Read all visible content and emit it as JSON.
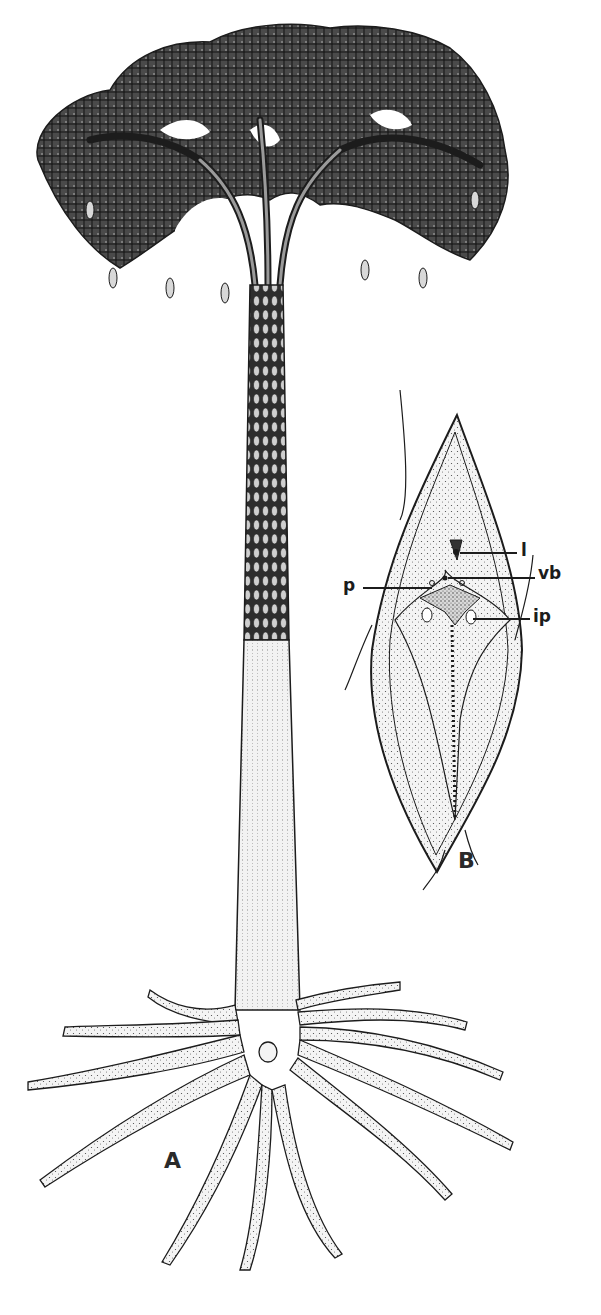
{
  "figure": {
    "panels": [
      {
        "id": "A",
        "label": "A",
        "subject": "whole arborescent lycopsid tree with crown, trunk and rooting system"
      },
      {
        "id": "B",
        "label": "B",
        "subject": "enlarged leaf cushion detail"
      }
    ],
    "callouts": {
      "l": "l",
      "vb": "vb",
      "p": "p",
      "ip": "ip"
    },
    "colors": {
      "ink": "#1c1c1c",
      "stipple": "#3a3a3a",
      "background": "#ffffff",
      "shade_light": "#e8e8e8",
      "shade_mid": "#bdbdbd"
    }
  }
}
